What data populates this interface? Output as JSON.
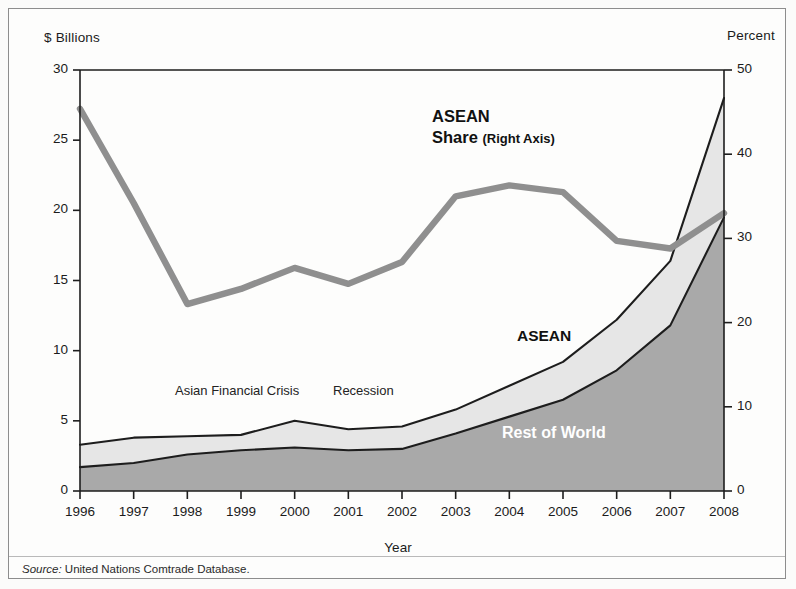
{
  "figure": {
    "left_axis_caption": "$ Billions",
    "right_axis_caption": "Percent",
    "xaxis_title": "Year",
    "source_prefix": "Source:",
    "source_text": "United Nations Comtrade Database.",
    "annotations": {
      "asian_financial_crisis": "Asian Financial Crisis",
      "recession": "Recession",
      "asean_band": "ASEAN",
      "rest_of_world_band": "Rest of World",
      "share_line_1": "ASEAN",
      "share_line_2": "Share",
      "share_line_3": "(Right Axis)"
    },
    "colors": {
      "rest_of_world_fill": "#a9a9a9",
      "asean_fill": "#e6e6e6",
      "share_line": "#8f8f8f",
      "outline": "#1d1d1d",
      "axis": "#1d1d1d",
      "page_background": "#fdfdfc"
    }
  },
  "chart_data": {
    "type": "area",
    "title": "",
    "subtitle": "",
    "xlabel": "Year",
    "ylabel": "$ Billions",
    "y2label": "Percent",
    "grid": false,
    "legend_position": "inline-annotations",
    "x": [
      1996,
      1997,
      1998,
      1999,
      2000,
      2001,
      2002,
      2003,
      2004,
      2005,
      2006,
      2007,
      2008
    ],
    "categories": [
      "1996",
      "1997",
      "1998",
      "1999",
      "2000",
      "2001",
      "2002",
      "2003",
      "2004",
      "2005",
      "2006",
      "2007",
      "2008"
    ],
    "xtick_labels": [
      "1996",
      "1997",
      "1998",
      "1999",
      "2000",
      "2001",
      "2002",
      "2003",
      "2004",
      "2005",
      "2006",
      "2007",
      "2008"
    ],
    "ytick_labels": [
      "0",
      "5",
      "10",
      "15",
      "20",
      "25",
      "30"
    ],
    "ytick_values": [
      0,
      5,
      10,
      15,
      20,
      25,
      30
    ],
    "ylim": [
      0,
      30
    ],
    "y2tick_labels": [
      "0",
      "10",
      "20",
      "30",
      "40",
      "50"
    ],
    "y2tick_values": [
      0,
      10,
      20,
      30,
      40,
      50
    ],
    "y2lim": [
      0,
      50
    ],
    "stacked": true,
    "series": [
      {
        "name": "Rest of World",
        "axis": "left",
        "unit": "$ Billions",
        "values": [
          1.7,
          2.0,
          2.6,
          2.9,
          3.1,
          2.9,
          3.0,
          4.1,
          5.3,
          6.5,
          8.6,
          11.8,
          19.5
        ]
      },
      {
        "name": "ASEAN",
        "axis": "left",
        "unit": "$ Billions",
        "values": [
          1.6,
          1.8,
          1.3,
          1.1,
          1.9,
          1.5,
          1.6,
          1.7,
          2.2,
          2.7,
          3.6,
          4.6,
          8.5
        ]
      }
    ],
    "totals": {
      "name": "Total",
      "axis": "left",
      "unit": "$ Billions",
      "values": [
        3.3,
        3.8,
        3.9,
        4.0,
        5.0,
        4.4,
        4.6,
        5.8,
        7.5,
        9.2,
        12.2,
        16.4,
        28.0
      ]
    },
    "share_line": {
      "name": "ASEAN Share (Right Axis)",
      "axis": "right",
      "unit": "Percent",
      "values": [
        45.4,
        34.2,
        22.2,
        24.0,
        26.5,
        24.6,
        27.2,
        35.0,
        36.3,
        35.5,
        29.7,
        28.8,
        33.0
      ]
    }
  }
}
